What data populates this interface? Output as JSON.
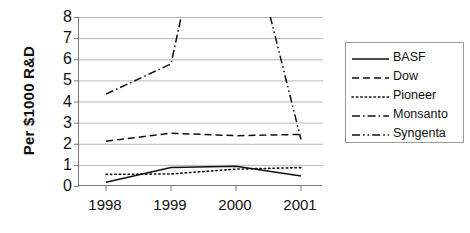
{
  "chart_data": {
    "type": "line",
    "title": "",
    "xlabel": "",
    "ylabel": "Per $1000 R&D",
    "categories": [
      "1998",
      "1999",
      "2000",
      "2001"
    ],
    "x_tick_labels": [
      "1998",
      "1999",
      "2000",
      "2001"
    ],
    "y_tick_labels": [
      "0",
      "1",
      "2",
      "3",
      "4",
      "5",
      "6",
      "7",
      "8"
    ],
    "ylim": [
      0,
      8
    ],
    "ytick_step": 1,
    "grid": "horizontal",
    "legend_position": "right",
    "series": [
      {
        "name": "BASF",
        "dash": "solid",
        "values": [
          0.18,
          0.88,
          0.93,
          0.47
        ]
      },
      {
        "name": "Dow",
        "dash": "dashed",
        "values": [
          2.12,
          2.5,
          2.38,
          2.44
        ]
      },
      {
        "name": "Pioneer",
        "dash": "dotted",
        "values": [
          0.55,
          0.57,
          0.8,
          0.87
        ]
      },
      {
        "name": "Monsanto",
        "dash": "dashdot",
        "values": [
          4.35,
          5.78,
          20.0,
          45.0
        ],
        "clipped_above": 8
      },
      {
        "name": "Syngenta",
        "dash": "dashdotdot",
        "values": [
          60.0,
          40.0,
          14.5,
          2.2
        ],
        "clipped_above": 8
      }
    ]
  },
  "legend": {
    "entries": [
      {
        "label": "BASF"
      },
      {
        "label": "Dow"
      },
      {
        "label": "Pioneer"
      },
      {
        "label": "Monsanto"
      },
      {
        "label": "Syngenta"
      }
    ]
  }
}
